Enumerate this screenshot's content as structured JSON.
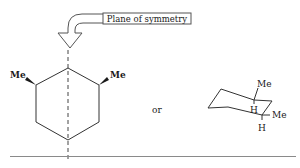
{
  "figure": {
    "callout": {
      "label": "Plane of symmetry",
      "arrow_icon": "curved-block-arrow-down"
    },
    "planar_structure": {
      "ring": "cyclohexane",
      "substituents": [
        {
          "label": "Me",
          "position": "left",
          "bond": "wedge"
        },
        {
          "label": "Me",
          "position": "right",
          "bond": "wedge"
        }
      ],
      "symmetry_line": "dashed-vertical"
    },
    "connector": "or",
    "chair_structure": {
      "ring": "cyclohexane-chair",
      "labels": [
        {
          "label": "Me",
          "role": "axial-up"
        },
        {
          "label": "H",
          "role": "equatorial"
        },
        {
          "label": "Me",
          "role": "equatorial"
        },
        {
          "label": "H",
          "role": "axial-down"
        }
      ]
    },
    "colors": {
      "line": "#333333",
      "text": "#1a1a1a",
      "rule": "#8a8a8a",
      "background": "#ffffff"
    }
  }
}
